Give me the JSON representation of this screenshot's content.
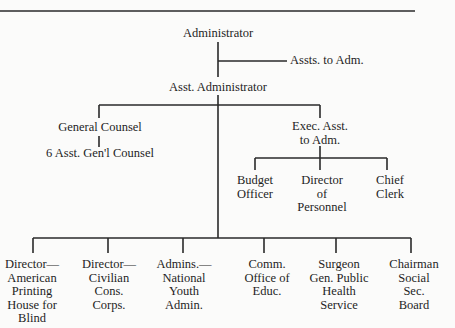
{
  "chart": {
    "title": "",
    "nodes": {
      "administrator": "Administrator",
      "assts_to_adm": "Assts. to Adm.",
      "asst_administrator": "Asst. Administrator",
      "general_counsel": "General Counsel",
      "asst_gen_counsel": "6 Asst. Gen'l Counsel",
      "exec_asst": "Exec. Asst.\nto Adm.",
      "budget_officer": "Budget\nOfficer",
      "director_personnel": "Director\nof\nPersonnel",
      "chief_clerk": "Chief\nClerk",
      "dir_printing_house": "Director—\nAmerican\nPrinting\nHouse for\nBlind",
      "dir_ccc": "Director—\nCivilian\nCons.\nCorps.",
      "admins_nya": "Admins.—\nNational\nYouth\nAdmin.",
      "comm_educ": "Comm.\nOffice of\nEduc.",
      "surgeon_general": "Surgeon\nGen. Public\nHealth\nService",
      "chairman_ssb": "Chairman\nSocial\nSec.\nBoard"
    }
  },
  "colors": {
    "line": "#2a2a2a",
    "text": "#1e1e1e",
    "background": "#fbfbfa"
  }
}
